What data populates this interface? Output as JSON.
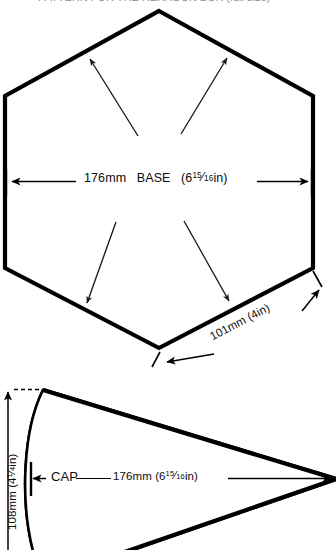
{
  "document": {
    "type": "technical-pattern-drawing",
    "title_clipped": "PATTERN FOR THE HEXAGON BOX (full size)",
    "background_color": "#ffffff",
    "line_color": "#000000"
  },
  "figures": [
    {
      "id": "hexagon-base",
      "name": "BASE",
      "shape": "hexagon",
      "label": "BASE",
      "width_mm": "176mm",
      "width_in_whole": "6",
      "width_in_num": "15",
      "width_in_den": "16",
      "width_in_suffix": "in",
      "edge_mm": "101mm",
      "edge_in": "(4in)",
      "vertices": [
        {
          "x": 159,
          "y": 11
        },
        {
          "x": 313,
          "y": 96
        },
        {
          "x": 313,
          "y": 268
        },
        {
          "x": 159,
          "y": 348
        },
        {
          "x": 5,
          "y": 268
        },
        {
          "x": 5,
          "y": 96
        }
      ],
      "leader_arrows": [
        {
          "from_x": 138,
          "from_y": 135,
          "to_x": 88,
          "to_y": 58
        },
        {
          "from_x": 181,
          "from_y": 133,
          "to_x": 228,
          "to_y": 57
        },
        {
          "from_x": 116,
          "from_y": 222,
          "to_x": 86,
          "to_y": 305
        },
        {
          "from_x": 184,
          "from_y": 220,
          "to_x": 230,
          "to_y": 303
        }
      ]
    },
    {
      "id": "cap-wedge",
      "name": "CAP",
      "shape": "curved-wedge",
      "label": "CAP",
      "width_mm": "176mm",
      "width_in_whole": "6",
      "width_in_num": "15",
      "width_in_den": "16",
      "width_in_suffix": "in",
      "height_mm": "108mm",
      "height_in_whole": "4",
      "height_in_num": "1",
      "height_in_den": "4",
      "height_in_suffix": "in",
      "apex": {
        "x": 336,
        "y": 479
      },
      "top_vertex": {
        "x": 43,
        "y": 390
      }
    }
  ],
  "labels": {
    "base_mm": "176mm",
    "base_name": "BASE",
    "edge_text": "101mm (4in)",
    "cap_name": "CAP",
    "cap_mm": "176mm",
    "height_mm": "108mm"
  }
}
